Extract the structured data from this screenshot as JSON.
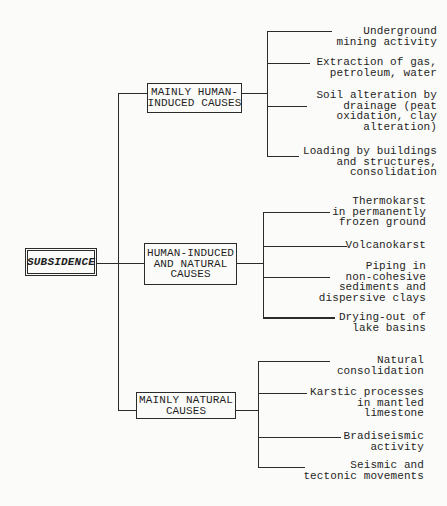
{
  "diagram": {
    "root_label": "SUBSIDENCE",
    "colors": {
      "ink": "#1f1f1f",
      "line": "#2b2b2b",
      "background": "#fbfbf9"
    },
    "groups": [
      {
        "label": "MAINLY HUMAN-\nINDUCED CAUSES",
        "leaves": [
          "Underground\nmining activity",
          "Extraction of gas,\npetroleum, water",
          "Soil alteration by\ndrainage (peat\noxidation, clay\nalteration)",
          "Loading by buildings\nand structures,\nconsolidation"
        ]
      },
      {
        "label": "HUMAN-INDUCED\nAND NATURAL\nCAUSES",
        "leaves": [
          "Thermokarst\nin permanently\nfrozen ground",
          "Volcanokarst",
          "Piping in\nnon-cohesive\nsediments and\ndispersive clays",
          "Drying-out of\nlake basins"
        ]
      },
      {
        "label": "MAINLY NATURAL\nCAUSES",
        "leaves": [
          "Natural\nconsolidation",
          "Karstic processes\nin mantled\nlimestone",
          "Bradiseismic\nactivity",
          "Seismic and\ntectonic movements"
        ]
      }
    ]
  }
}
